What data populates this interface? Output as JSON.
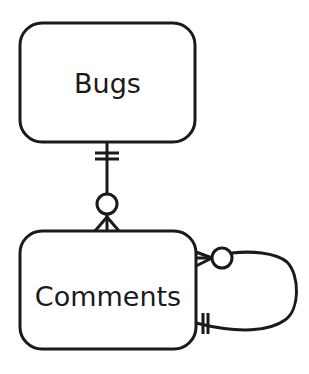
{
  "diagram": {
    "type": "entity-relationship",
    "notation": "crows-foot",
    "stroke_color": "#1a1a1a",
    "background": "#ffffff",
    "entities": [
      {
        "id": "bugs",
        "label": "Bugs"
      },
      {
        "id": "comments",
        "label": "Comments"
      }
    ],
    "relationships": [
      {
        "from": "bugs",
        "to": "comments",
        "from_cardinality": "exactly-one",
        "to_cardinality": "zero-or-many"
      },
      {
        "from": "comments",
        "to": "comments",
        "from_cardinality": "exactly-one",
        "to_cardinality": "zero-or-many",
        "self_referencing": true
      }
    ]
  }
}
